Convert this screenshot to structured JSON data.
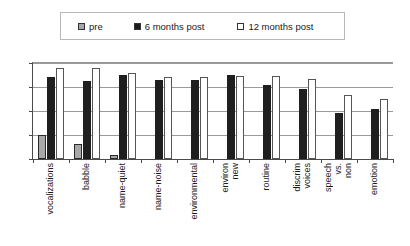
{
  "legend": {
    "items": [
      {
        "label": "pre",
        "swatch": "legend-swatch-pre",
        "color": "#a6a6a6"
      },
      {
        "label": "6 months post",
        "swatch": "legend-swatch-6-months-post",
        "color": "#1c1c1c"
      },
      {
        "label": "12 months post",
        "swatch": "legend-swatch-12-months-post",
        "color": "#ffffff"
      }
    ]
  },
  "axis": {
    "y_ticks": [
      "0",
      "1",
      "2",
      "3",
      "4"
    ]
  },
  "chart_data": {
    "type": "bar",
    "title": "",
    "xlabel": "",
    "ylabel": "",
    "ylim": [
      0,
      4
    ],
    "yticks": [
      0,
      1,
      2,
      3,
      4
    ],
    "grid": true,
    "legend_position": "top",
    "categories": [
      "vocalizations",
      "babble",
      "name-quiet",
      "name-noise",
      "environmental",
      "environ new",
      "routine",
      "discrim voices",
      "speech vs. non",
      "emotion"
    ],
    "series": [
      {
        "name": "pre",
        "color": "#a6a6a6",
        "values": [
          1.0,
          0.62,
          0.15,
          0,
          0,
          0,
          0,
          0,
          0,
          0
        ]
      },
      {
        "name": "6 months post",
        "color": "#1c1c1c",
        "values": [
          3.4,
          3.25,
          3.5,
          3.3,
          3.3,
          3.5,
          3.1,
          2.9,
          1.9,
          2.1
        ]
      },
      {
        "name": "12 months post",
        "color": "#ffffff",
        "values": [
          3.8,
          3.8,
          3.6,
          3.4,
          3.4,
          3.45,
          3.45,
          3.35,
          2.65,
          2.5
        ]
      }
    ]
  }
}
